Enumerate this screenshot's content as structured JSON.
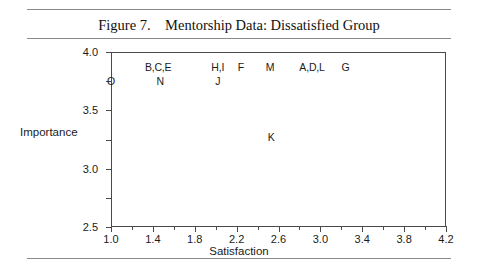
{
  "figure": {
    "title": "Figure 7.    Mentorship Data: Dissatisfied Group"
  },
  "chart_data": {
    "type": "scatter",
    "title": "Figure 7.    Mentorship Data: Dissatisfied Group",
    "xlabel": "Satisfaction",
    "ylabel": "Importance",
    "xlim": [
      1.0,
      4.2
    ],
    "ylim": [
      1.0,
      4.0
    ],
    "xticks": [
      1.0,
      1.4,
      1.8,
      2.2,
      2.6,
      3.0,
      3.4,
      3.8,
      4.2
    ],
    "xtick_labels": [
      "1.0",
      "1.4",
      "1.8",
      "2.2",
      "2.6",
      "3.0",
      "3.4",
      "3.8",
      "4.2"
    ],
    "xminor_ticks": [
      1.2,
      1.6,
      2.0,
      2.4,
      2.8,
      3.2,
      3.6,
      4.0
    ],
    "yticks": [
      1.0,
      1.5,
      2.0,
      2.5,
      3.0,
      3.5,
      4.0
    ],
    "ytick_labels": [
      "1.0",
      "1.5",
      "2.0",
      "2.5",
      "3.0",
      "3.5",
      "4.0"
    ],
    "grid": false,
    "legend": "none",
    "reference_lines": [
      {
        "orientation": "horizontal",
        "value": 2.5,
        "axis": "y"
      },
      {
        "orientation": "vertical",
        "value": 2.6,
        "axis": "x"
      }
    ],
    "points": [
      {
        "label": "O",
        "x": 1.0,
        "y": 3.5
      },
      {
        "label": "B,C,E",
        "x": 1.45,
        "y": 3.75
      },
      {
        "label": "N",
        "x": 1.47,
        "y": 3.5
      },
      {
        "label": "H,I",
        "x": 2.02,
        "y": 3.75
      },
      {
        "label": "J",
        "x": 2.02,
        "y": 3.5
      },
      {
        "label": "F",
        "x": 2.24,
        "y": 3.75
      },
      {
        "label": "M",
        "x": 2.52,
        "y": 3.75
      },
      {
        "label": "A,D,L",
        "x": 2.92,
        "y": 3.75
      },
      {
        "label": "G",
        "x": 3.24,
        "y": 3.75
      },
      {
        "label": "K",
        "x": 2.53,
        "y": 2.55
      }
    ]
  }
}
